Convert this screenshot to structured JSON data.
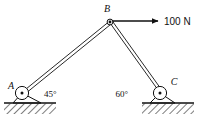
{
  "figure": {
    "type": "engineering-statics-free-body-diagram",
    "background_color": "#ffffff",
    "line_color": "#111111",
    "hatch_color": "#111111"
  },
  "joints": {
    "a": {
      "label": "A",
      "x": 22,
      "y": 93,
      "support_type": "pin",
      "on_ground": true
    },
    "b": {
      "label": "B",
      "x": 110,
      "y": 22,
      "support_type": "pin-joint",
      "on_ground": false
    },
    "c": {
      "label": "C",
      "x": 160,
      "y": 93,
      "support_type": "pin",
      "on_ground": true
    }
  },
  "members": [
    {
      "name": "member-ab",
      "from": "A",
      "to": "B",
      "style": "double-line-bar"
    },
    {
      "name": "member-bc",
      "from": "B",
      "to": "C",
      "style": "double-line-bar"
    }
  ],
  "angles": [
    {
      "name": "angle-at-a",
      "value": "45°",
      "at_joint": "A",
      "label_x": 44,
      "label_y": 97
    },
    {
      "name": "angle-at-c",
      "value": "60°",
      "at_joint": "C",
      "label_x": 128,
      "label_y": 97
    }
  ],
  "load": {
    "label": "100 N",
    "magnitude": 100,
    "unit": "N",
    "direction": "horizontal-right",
    "applied_at": "B",
    "arrow_start_x": 113,
    "arrow_end_x": 160,
    "arrow_y": 21,
    "label_x": 164,
    "label_y": 25
  },
  "ground": [
    {
      "name": "ground-left",
      "x": 4,
      "y": 103,
      "width": 52,
      "height": 11
    },
    {
      "name": "ground-right",
      "x": 142,
      "y": 103,
      "width": 52,
      "height": 11
    }
  ]
}
